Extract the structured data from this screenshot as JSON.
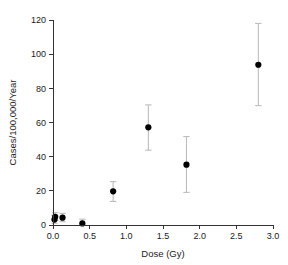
{
  "chart_data": {
    "type": "scatter",
    "title": "",
    "xlabel": "Dose (Gy)",
    "ylabel": "Cases/100,000/Year",
    "xlim": [
      0.0,
      3.0
    ],
    "ylim": [
      0,
      120
    ],
    "xticks": [
      "0.0",
      "0.5",
      "1.0",
      "1.5",
      "2.0",
      "2.5",
      "3.0"
    ],
    "xtick_values": [
      0.0,
      0.5,
      1.0,
      1.5,
      2.0,
      2.5,
      3.0
    ],
    "yticks": [
      "0",
      "20",
      "40",
      "60",
      "80",
      "100",
      "120"
    ],
    "ytick_values": [
      0,
      20,
      40,
      60,
      80,
      100,
      120
    ],
    "grid": false,
    "legend": false,
    "marker": "filled-circle",
    "marker_color": "#000000",
    "errorbar_color": "#bdbdbd",
    "points": [
      {
        "x": 0.02,
        "y": 3.2,
        "y_low": 1.0,
        "y_high": 5.6
      },
      {
        "x": 0.03,
        "y": 4.8,
        "y_low": 2.6,
        "y_high": 7.2
      },
      {
        "x": 0.13,
        "y": 4.3,
        "y_low": 1.9,
        "y_high": 6.8
      },
      {
        "x": 0.4,
        "y": 0.9,
        "y_low": 0.0,
        "y_high": 3.4
      },
      {
        "x": 0.82,
        "y": 19.7,
        "y_low": 13.8,
        "y_high": 25.4
      },
      {
        "x": 1.3,
        "y": 57.2,
        "y_low": 43.8,
        "y_high": 70.3
      },
      {
        "x": 1.82,
        "y": 35.3,
        "y_low": 19.1,
        "y_high": 51.8
      },
      {
        "x": 2.8,
        "y": 93.8,
        "y_low": 69.9,
        "y_high": 118.0
      }
    ]
  }
}
